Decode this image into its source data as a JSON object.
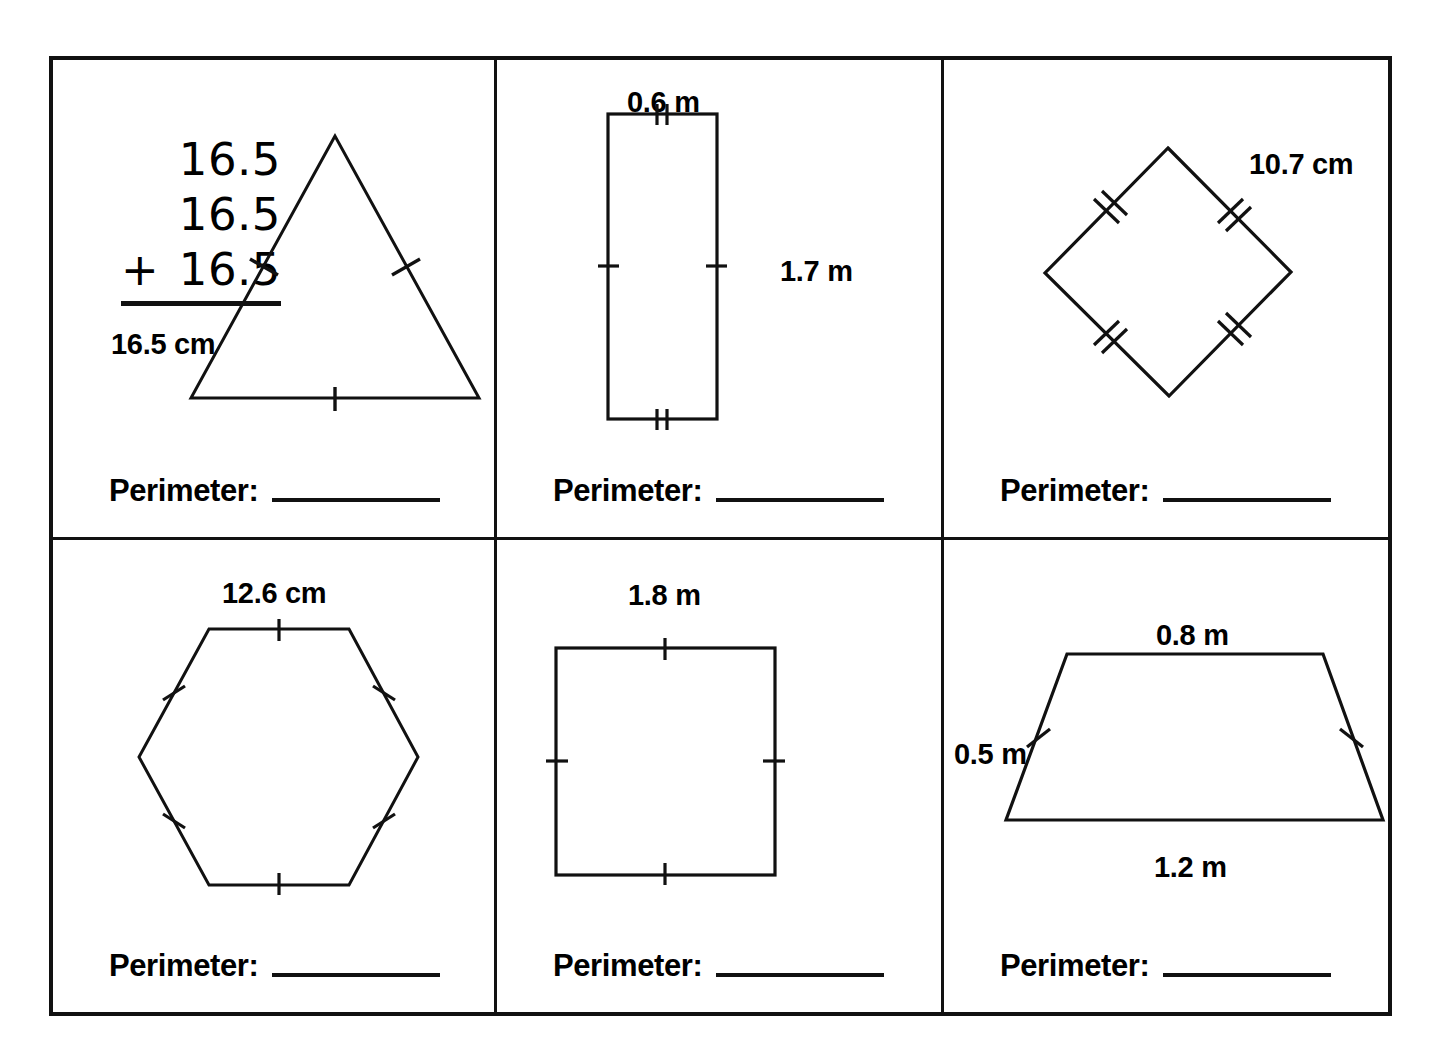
{
  "worksheet": {
    "perimeter_label": "Perimeter:",
    "answer_value": ""
  },
  "cells": [
    {
      "id": "triangle",
      "shape": "equilateral-triangle",
      "side_label": "16.5 cm",
      "tick_count": 1,
      "tick_sides": 3,
      "work": {
        "addends": [
          "16.5",
          "16.5",
          "16.5"
        ],
        "operator": "+",
        "line1": "16.5",
        "line2": "16.5",
        "line3": "16.5"
      }
    },
    {
      "id": "rectangle",
      "shape": "rectangle",
      "top_label": "0.6 m",
      "side_label": "1.7 m",
      "top_tick_count": 2,
      "side_tick_count": 1
    },
    {
      "id": "rhombus",
      "shape": "rhombus",
      "side_label": "10.7 cm",
      "tick_count": 2,
      "tick_sides": 4
    },
    {
      "id": "hexagon",
      "shape": "regular-hexagon",
      "side_label": "12.6 cm",
      "tick_count": 1,
      "tick_sides": 6
    },
    {
      "id": "square",
      "shape": "square",
      "side_label": "1.8 m",
      "tick_count": 1,
      "tick_sides": 4
    },
    {
      "id": "trapezoid",
      "shape": "isosceles-trapezoid",
      "top_label": "0.8 m",
      "bottom_label": "1.2 m",
      "leg_label": "0.5 m",
      "leg_tick_count": 1
    }
  ],
  "colors": {
    "ink": "#111111",
    "paper": "#ffffff"
  }
}
